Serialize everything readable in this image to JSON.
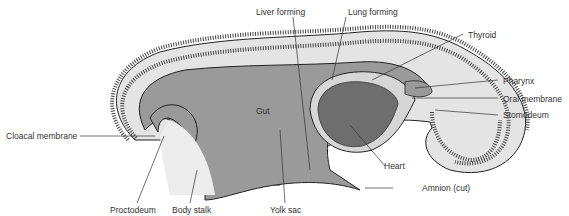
{
  "diagram": {
    "title": "",
    "colors": {
      "gut": "#9a9a9a",
      "heart": "#6e6e6e",
      "ectoderm_fill": "#e4e4e4",
      "outline": "#222222",
      "stroke_line": "#333333"
    },
    "labels": {
      "liver_forming": "Liver forming",
      "lung_forming": "Lung forming",
      "thyroid": "Thyroid",
      "pharynx": "Pharynx",
      "oral_membrane": "Oral membrane",
      "stomodeum": "Stomodeum",
      "gut": "Gut",
      "cloacal_membrane": "Cloacal membrane",
      "heart": "Heart",
      "amnion_cut": "Amnion (cut)",
      "proctodeum": "Proctodeum",
      "body_stalk": "Body stalk",
      "yolk_sac": "Yolk sac"
    }
  }
}
